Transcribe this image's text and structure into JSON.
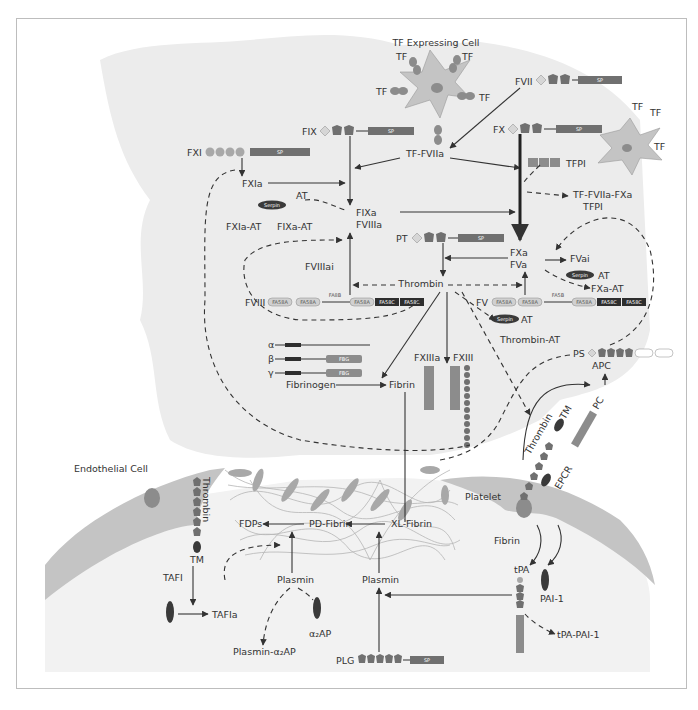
{
  "colors": {
    "blood_region": "#ececec",
    "cell_fill": "#c4c4c4",
    "nucleus": "#8c8c8c",
    "domain_dark": "#707070",
    "domain_black": "#2e2e2e",
    "serpin": "#3a3a3a",
    "fibrin_mesh": "#b5b5b5",
    "line": "#333333",
    "frame": "#bdbdbd"
  },
  "labels": {
    "tf_expressing_cell": "TF Expressing Cell",
    "tf": "TF",
    "fvii": "FVII",
    "fix": "FIX",
    "fxi": "FXI",
    "fx": "FX",
    "tf_fviia": "TF-FVIIa",
    "tfpi": "TFPI",
    "tf_fviia_fxa": "TF-FVIIa-FXa",
    "tfpi2": "TFPI",
    "fxia": "FXIa",
    "at": "AT",
    "serpin": "Serpin",
    "fixa": "FIXa",
    "fviiia": "FVIIIa",
    "fxia_at": "FXIa-AT",
    "fixa_at": "FIXa-AT",
    "pt": "PT",
    "fxa": "FXa",
    "fva": "FVa",
    "fvai": "FVai",
    "fxa_at": "FXa-AT",
    "fviiiai": "FVIIIai",
    "thrombin": "Thrombin",
    "fviii": "FVIII",
    "fv": "FV",
    "fa58a": "FA58A",
    "fa58c": "FA58C",
    "fa8b": "FA8B",
    "fa5b": "FA5B",
    "thrombin_at": "Thrombin-AT",
    "ps": "PS",
    "apc": "APC",
    "pc": "PC",
    "tm": "TM",
    "epcr": "EPCR",
    "lamg": "LamG",
    "alpha": "α",
    "beta": "β",
    "gamma": "γ",
    "fbg": "FBG",
    "fibrinogen": "Fibrinogen",
    "fibrin": "Fibrin",
    "fxiiia": "FXIIIa",
    "fxiii": "FXIII",
    "tg": "TG",
    "endothelial_cell": "Endothelial Cell",
    "platelet": "Platelet",
    "fibrin_mesh": "Fibrin",
    "fdps": "FDPs",
    "pd_fibrin": "PD-Fibrin",
    "xl_fibrin": "XL-Fibrin",
    "plasmin_left": "Plasmin",
    "plasmin_right": "Plasmin",
    "tafi": "TAFI",
    "tafia": "TAFIa",
    "alpha2ap": "α₂AP",
    "plasmin_alpha2ap": "Plasmin-α₂AP",
    "plg": "PLG",
    "tpa": "tPA",
    "pai1": "PAI-1",
    "tpa_pai1": "tPA-PAI-1",
    "sp": "SP",
    "ap": "AP",
    "eg": "EG",
    "kr": "KR",
    "ku": "KU",
    "gla": "γ"
  }
}
